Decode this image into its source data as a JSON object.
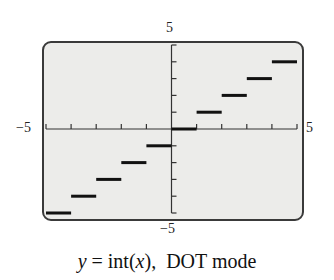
{
  "chart_data": {
    "type": "line",
    "xlabel": "",
    "ylabel": "",
    "xlim": [
      -5,
      5
    ],
    "ylim": [
      -5,
      5
    ],
    "x_tick_step": 1,
    "y_tick_step": 1,
    "grid": false,
    "legend": null,
    "series": [
      {
        "name": "y = int(x)",
        "segments": [
          {
            "x0": -5,
            "x1": -4,
            "y": -5
          },
          {
            "x0": -4,
            "x1": -3,
            "y": -4
          },
          {
            "x0": -3,
            "x1": -2,
            "y": -3
          },
          {
            "x0": -2,
            "x1": -1,
            "y": -2
          },
          {
            "x0": -1,
            "x1": 0,
            "y": -1
          },
          {
            "x0": 0,
            "x1": 1,
            "y": 0
          },
          {
            "x0": 1,
            "x1": 2,
            "y": 1
          },
          {
            "x0": 2,
            "x1": 3,
            "y": 2
          },
          {
            "x0": 3,
            "x1": 4,
            "y": 3
          },
          {
            "x0": 4,
            "x1": 5,
            "y": 4
          }
        ]
      }
    ]
  },
  "labels": {
    "ymax": "5",
    "ymin": "−5",
    "xmin": "−5",
    "xmax": "5"
  },
  "caption": {
    "var": "y",
    "eq": " = int(",
    "arg": "x",
    "close": "),",
    "mode": "DOT mode"
  },
  "colors": {
    "frame_bg": "#ececea",
    "axis": "#333333",
    "step": "#111111"
  }
}
